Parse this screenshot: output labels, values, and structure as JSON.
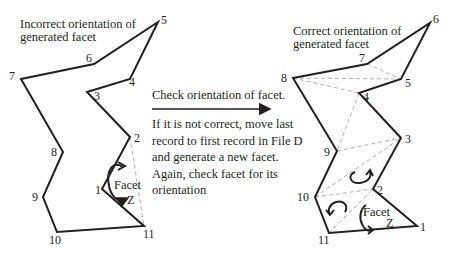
{
  "colors": {
    "ink": "#231f20",
    "dashed": "#b0b0b0"
  },
  "left_figure": {
    "title_line1": "Incorrect orientation of",
    "title_line2": "generated facet",
    "vertices": [
      {
        "id": "1",
        "x": 102,
        "y": 189,
        "lx": 95,
        "ly": 194
      },
      {
        "id": "2",
        "x": 130,
        "y": 137,
        "lx": 134,
        "ly": 142
      },
      {
        "id": "3",
        "x": 87,
        "y": 92,
        "lx": 94,
        "ly": 100
      },
      {
        "id": "4",
        "x": 130,
        "y": 79,
        "lx": 129,
        "ly": 86
      },
      {
        "id": "5",
        "x": 158,
        "y": 22,
        "lx": 161,
        "ly": 24
      },
      {
        "id": "6",
        "x": 94,
        "y": 64,
        "lx": 86,
        "ly": 62
      },
      {
        "id": "7",
        "x": 21,
        "y": 79,
        "lx": 9,
        "ly": 80
      },
      {
        "id": "8",
        "x": 63,
        "y": 152,
        "lx": 51,
        "ly": 156
      },
      {
        "id": "9",
        "x": 43,
        "y": 197,
        "lx": 32,
        "ly": 201
      },
      {
        "id": "10",
        "x": 57,
        "y": 232,
        "lx": 49,
        "ly": 244
      },
      {
        "id": "11",
        "x": 144,
        "y": 226,
        "lx": 143,
        "ly": 238
      }
    ],
    "outline_order": [
      "1",
      "2",
      "3",
      "4",
      "5",
      "6",
      "7",
      "8",
      "9",
      "10",
      "11"
    ],
    "dashed_edges": [
      [
        "2",
        "11"
      ]
    ],
    "facet_label": "Facet",
    "facet_name": "Z"
  },
  "middle": {
    "arrow_label": "Check orientation of facet.",
    "instructions": [
      "If it is not correct, move last",
      "record to first record in File D",
      "and generate a new facet.",
      "Again, check facet for its",
      "orientation"
    ]
  },
  "right_figure": {
    "title_line1": "Correct orientation of",
    "title_line2": "generated facet",
    "vertices": [
      {
        "id": "1",
        "x": 417,
        "y": 226,
        "lx": 420,
        "ly": 231
      },
      {
        "id": "2",
        "x": 373,
        "y": 189,
        "lx": 377,
        "ly": 194
      },
      {
        "id": "3",
        "x": 401,
        "y": 138,
        "lx": 405,
        "ly": 143
      },
      {
        "id": "4",
        "x": 359,
        "y": 93,
        "lx": 363,
        "ly": 101
      },
      {
        "id": "5",
        "x": 401,
        "y": 79,
        "lx": 405,
        "ly": 87
      },
      {
        "id": "6",
        "x": 430,
        "y": 23,
        "lx": 433,
        "ly": 23
      },
      {
        "id": "7",
        "x": 367,
        "y": 64,
        "lx": 359,
        "ly": 62
      },
      {
        "id": "8",
        "x": 293,
        "y": 78,
        "lx": 281,
        "ly": 82
      },
      {
        "id": "9",
        "x": 337,
        "y": 151,
        "lx": 324,
        "ly": 156
      },
      {
        "id": "10",
        "x": 315,
        "y": 197,
        "lx": 297,
        "ly": 201
      },
      {
        "id": "11",
        "x": 329,
        "y": 233,
        "lx": 318,
        "ly": 244
      }
    ],
    "outline_order": [
      "1",
      "2",
      "3",
      "4",
      "5",
      "6",
      "7",
      "8",
      "9",
      "10",
      "11"
    ],
    "dashed_edges": [
      [
        "7",
        "5"
      ],
      [
        "8",
        "5"
      ],
      [
        "8",
        "4"
      ],
      [
        "4",
        "9"
      ],
      [
        "9",
        "3"
      ],
      [
        "10",
        "3"
      ],
      [
        "10",
        "2"
      ],
      [
        "11",
        "2"
      ]
    ],
    "facet_label": "Facet",
    "facet_name": "Z"
  }
}
